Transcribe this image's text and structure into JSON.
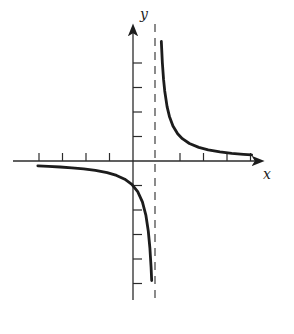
{
  "figure": {
    "background": "#ffffff",
    "curve_color": "#1c1c1c",
    "axis_color": "#2b2b2b",
    "asymptote_color": "#5a5a5a",
    "x_axis_label": "x",
    "y_axis_label": "y"
  },
  "chart_data": {
    "type": "line",
    "title": "",
    "xlabel": "x",
    "ylabel": "y",
    "xlim": [
      -5.1,
      5.8
    ],
    "ylim": [
      -5.9,
      5.9
    ],
    "grid": false,
    "legend": false,
    "x_ticks": [
      -4,
      -3,
      -2,
      -1,
      2,
      3,
      4,
      5
    ],
    "y_ticks": [
      -5,
      -4,
      -3,
      -2,
      -1,
      1,
      2,
      3,
      4
    ],
    "tick_labels_shown": false,
    "vertical_asymptote_x": 1,
    "horizontal_asymptote_y": 0,
    "y_intercept": -1,
    "series": [
      {
        "name": "right-branch",
        "x": [
          1.205,
          1.25,
          1.3,
          1.35,
          1.45,
          1.55,
          1.7,
          1.9,
          2.1,
          2.4,
          2.8,
          3.2,
          3.7,
          4.2,
          4.7,
          5.05
        ],
        "y": [
          4.88,
          4.0,
          3.33,
          2.86,
          2.22,
          1.82,
          1.43,
          1.11,
          0.91,
          0.714,
          0.556,
          0.455,
          0.37,
          0.3125,
          0.27,
          0.247
        ]
      },
      {
        "name": "left-branch",
        "x": [
          -4.05,
          -3.6,
          -3.1,
          -2.6,
          -2.1,
          -1.6,
          -1.1,
          -0.7,
          -0.35,
          -0.05,
          0.2,
          0.4,
          0.55,
          0.65,
          0.72,
          0.77,
          0.795
        ],
        "y": [
          -0.198,
          -0.217,
          -0.244,
          -0.278,
          -0.323,
          -0.385,
          -0.476,
          -0.588,
          -0.741,
          -0.952,
          -1.25,
          -1.667,
          -2.222,
          -2.857,
          -3.571,
          -4.348,
          -4.878
        ]
      }
    ],
    "pixel_mapping": {
      "origin_x": 133,
      "origin_y": 161,
      "unit_x": 23.5,
      "unit_y": 24.5,
      "x_axis_from_px": 13,
      "x_axis_to_px": 262,
      "y_axis_from_px": 300,
      "y_axis_to_px": 26,
      "asymptote_top_px": 24,
      "asymptote_bottom_px": 300,
      "x_tick_len": 8,
      "y_tick_len": 9
    }
  }
}
